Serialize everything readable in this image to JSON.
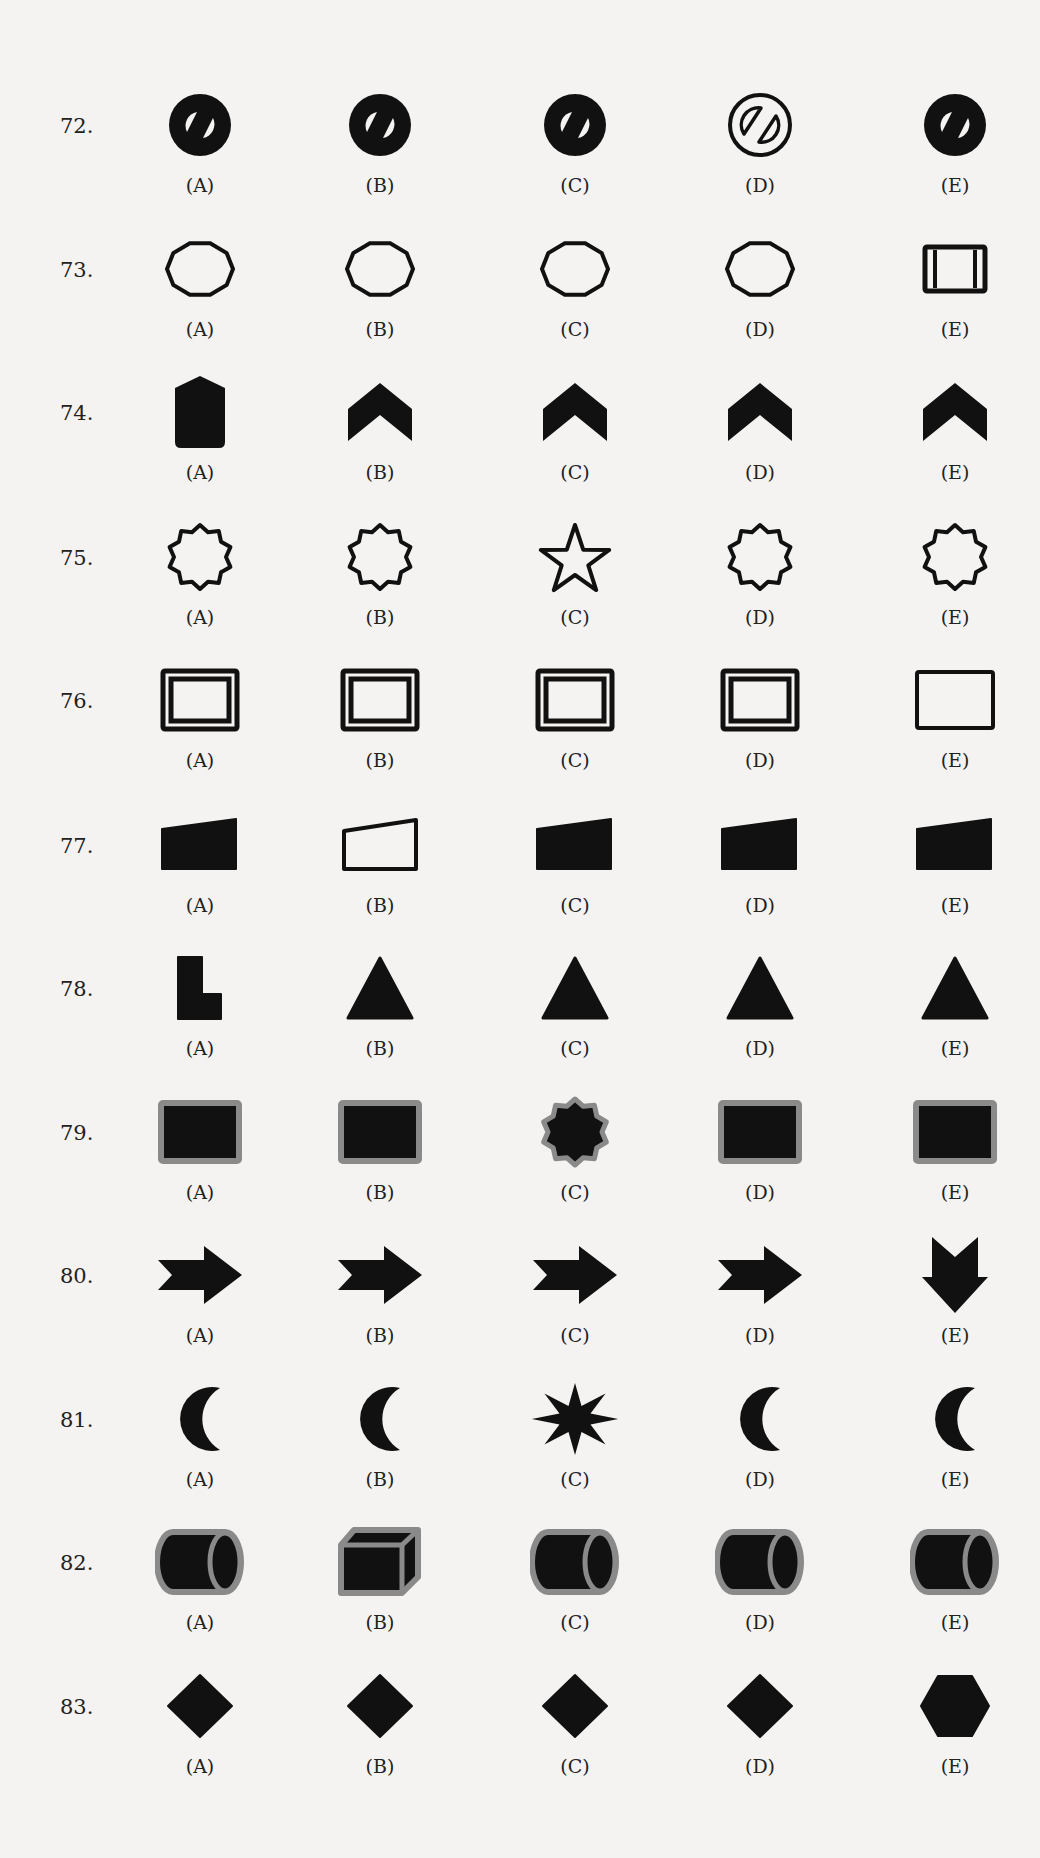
{
  "questions": [
    {
      "number": "72.",
      "options": [
        {
          "label": "(A)",
          "shape": "solid-circle-with-slash"
        },
        {
          "label": "(B)",
          "shape": "solid-circle-with-slash"
        },
        {
          "label": "(C)",
          "shape": "solid-circle-with-slash"
        },
        {
          "label": "(D)",
          "shape": "outlined-circle-with-slash"
        },
        {
          "label": "(E)",
          "shape": "solid-circle-with-slash"
        }
      ]
    },
    {
      "number": "73.",
      "options": [
        {
          "label": "(A)",
          "shape": "decagon-outline"
        },
        {
          "label": "(B)",
          "shape": "decagon-outline"
        },
        {
          "label": "(C)",
          "shape": "decagon-outline"
        },
        {
          "label": "(D)",
          "shape": "decagon-outline"
        },
        {
          "label": "(E)",
          "shape": "square-with-side-lines"
        }
      ]
    },
    {
      "number": "74.",
      "options": [
        {
          "label": "(A)",
          "shape": "solid-pointed-barrel"
        },
        {
          "label": "(B)",
          "shape": "solid-chevron-up"
        },
        {
          "label": "(C)",
          "shape": "solid-chevron-up"
        },
        {
          "label": "(D)",
          "shape": "solid-chevron-up"
        },
        {
          "label": "(E)",
          "shape": "solid-chevron-up"
        }
      ]
    },
    {
      "number": "75.",
      "options": [
        {
          "label": "(A)",
          "shape": "ten-point-star-outline"
        },
        {
          "label": "(B)",
          "shape": "ten-point-star-outline"
        },
        {
          "label": "(C)",
          "shape": "five-point-star-outline"
        },
        {
          "label": "(D)",
          "shape": "ten-point-star-outline"
        },
        {
          "label": "(E)",
          "shape": "ten-point-star-outline"
        }
      ]
    },
    {
      "number": "76.",
      "options": [
        {
          "label": "(A)",
          "shape": "double-border-rectangle"
        },
        {
          "label": "(B)",
          "shape": "double-border-rectangle"
        },
        {
          "label": "(C)",
          "shape": "double-border-rectangle"
        },
        {
          "label": "(D)",
          "shape": "double-border-rectangle"
        },
        {
          "label": "(E)",
          "shape": "single-border-rectangle"
        }
      ]
    },
    {
      "number": "77.",
      "options": [
        {
          "label": "(A)",
          "shape": "solid-trapezoid"
        },
        {
          "label": "(B)",
          "shape": "outlined-trapezoid"
        },
        {
          "label": "(C)",
          "shape": "solid-trapezoid"
        },
        {
          "label": "(D)",
          "shape": "solid-trapezoid"
        },
        {
          "label": "(E)",
          "shape": "solid-trapezoid"
        }
      ]
    },
    {
      "number": "78.",
      "options": [
        {
          "label": "(A)",
          "shape": "solid-l-shape"
        },
        {
          "label": "(B)",
          "shape": "solid-triangle"
        },
        {
          "label": "(C)",
          "shape": "solid-triangle"
        },
        {
          "label": "(D)",
          "shape": "solid-triangle"
        },
        {
          "label": "(E)",
          "shape": "solid-triangle"
        }
      ]
    },
    {
      "number": "79.",
      "options": [
        {
          "label": "(A)",
          "shape": "black-rectangle-gray-border"
        },
        {
          "label": "(B)",
          "shape": "black-rectangle-gray-border"
        },
        {
          "label": "(C)",
          "shape": "black-star-gray-border"
        },
        {
          "label": "(D)",
          "shape": "black-rectangle-gray-border"
        },
        {
          "label": "(E)",
          "shape": "black-rectangle-gray-border"
        }
      ]
    },
    {
      "number": "80.",
      "options": [
        {
          "label": "(A)",
          "shape": "solid-arrow-right"
        },
        {
          "label": "(B)",
          "shape": "solid-arrow-right"
        },
        {
          "label": "(C)",
          "shape": "solid-arrow-right"
        },
        {
          "label": "(D)",
          "shape": "solid-arrow-right"
        },
        {
          "label": "(E)",
          "shape": "solid-arrow-down"
        }
      ]
    },
    {
      "number": "81.",
      "options": [
        {
          "label": "(A)",
          "shape": "solid-crescent"
        },
        {
          "label": "(B)",
          "shape": "solid-crescent"
        },
        {
          "label": "(C)",
          "shape": "solid-eight-point-star"
        },
        {
          "label": "(D)",
          "shape": "solid-crescent"
        },
        {
          "label": "(E)",
          "shape": "solid-crescent"
        }
      ]
    },
    {
      "number": "82.",
      "options": [
        {
          "label": "(A)",
          "shape": "cylinder-gray-border"
        },
        {
          "label": "(B)",
          "shape": "cube-gray-border"
        },
        {
          "label": "(C)",
          "shape": "cylinder-gray-border"
        },
        {
          "label": "(D)",
          "shape": "cylinder-gray-border"
        },
        {
          "label": "(E)",
          "shape": "cylinder-gray-border"
        }
      ]
    },
    {
      "number": "83.",
      "options": [
        {
          "label": "(A)",
          "shape": "solid-diamond"
        },
        {
          "label": "(B)",
          "shape": "solid-diamond"
        },
        {
          "label": "(C)",
          "shape": "solid-diamond"
        },
        {
          "label": "(D)",
          "shape": "solid-diamond"
        },
        {
          "label": "(E)",
          "shape": "solid-hexagon"
        }
      ]
    }
  ],
  "colors": {
    "ink": "#111111",
    "gray_border": "#8a8a8a",
    "paper": "#f4f3f1"
  }
}
